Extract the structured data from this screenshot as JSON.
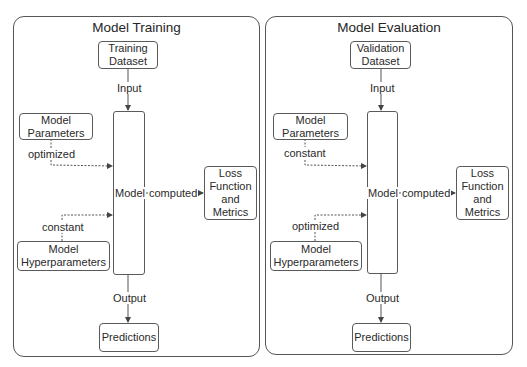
{
  "panels": [
    {
      "title": "Model Training",
      "dataset": "Training\nDataset",
      "input_label": "Input",
      "params_box": "Model\nParameters",
      "params_label": "optimized",
      "hyper_box": "Model\nHyperparameters",
      "hyper_label": "constant",
      "model_label": "Model",
      "computed_label": "computed",
      "loss_box": "Loss\nFunction\nand\nMetrics",
      "output_label": "Output",
      "predictions_box": "Predictions"
    },
    {
      "title": "Model Evaluation",
      "dataset": "Validation\nDataset",
      "input_label": "Input",
      "params_box": "Model\nParameters",
      "params_label": "constant",
      "hyper_box": "Model\nHyperparameters",
      "hyper_label": "optimized",
      "model_label": "Model",
      "computed_label": "computed",
      "loss_box": "Loss\nFunction\nand\nMetrics",
      "output_label": "Output",
      "predictions_box": "Predictions"
    }
  ],
  "colors": {
    "line": "#555555",
    "text": "#2a2a2a",
    "background": "#ffffff"
  }
}
